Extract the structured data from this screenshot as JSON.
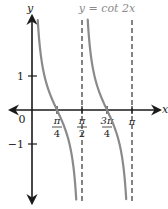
{
  "chart_data": {
    "type": "line",
    "title": "y = cot 2x",
    "xlabel": "x",
    "ylabel": "y",
    "function": "cot(2x)",
    "x_ticks": [
      {
        "value": 0,
        "label": "0"
      },
      {
        "value": 0.7854,
        "label_num": "π",
        "label_den": "4"
      },
      {
        "value": 1.5708,
        "label_num": "π",
        "label_den": "2"
      },
      {
        "value": 2.3562,
        "label_num": "3π",
        "label_den": "4"
      },
      {
        "value": 3.1416,
        "label": "π"
      }
    ],
    "y_ticks": [
      {
        "value": 1,
        "label": "1"
      },
      {
        "value": -1,
        "label": "−1"
      }
    ],
    "asymptotes_x": [
      1.5708,
      3.1416
    ],
    "branches": [
      {
        "domain": [
          0.02,
          1.55
        ]
      },
      {
        "domain": [
          1.59,
          3.12
        ]
      }
    ],
    "xlim": [
      -0.75,
      4.0
    ],
    "ylim": [
      -2.8,
      2.8
    ],
    "grid": false,
    "legend": null,
    "colors": {
      "curve": "#8a8a8a",
      "axes": "#1a1a1a",
      "asymptote": "#333333",
      "title": "#8a8a8a"
    }
  }
}
